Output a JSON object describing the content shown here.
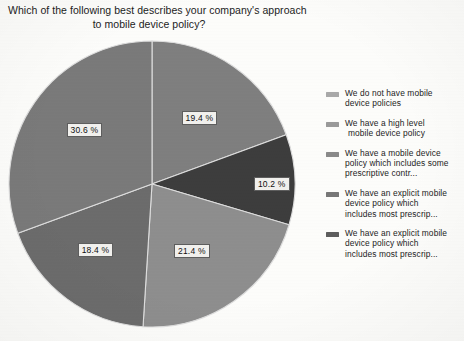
{
  "chart_data": {
    "type": "pie",
    "title": "Which of the following best describes your company's approach to mobile device policy?",
    "title_lines": [
      "Which of the following best describes your company's approach",
      "to mobile device policy?"
    ],
    "categories": [
      "We do not have mobile device policies",
      "We have a high level mobile device policy",
      "We have a mobile device policy which includes some prescriptive contr...",
      "We have an explicit mobile device policy which includes most prescrip...",
      "We have an explicit mobile device policy which includes most prescrip..."
    ],
    "values": [
      19.4,
      10.2,
      21.4,
      18.4,
      30.6
    ],
    "value_labels": [
      "19.4 %",
      "10.2 %",
      "21.4 %",
      "18.4 %",
      "30.6 %"
    ],
    "colors": [
      "#7f7f7f",
      "#3d3d3d",
      "#8e8e8e",
      "#6c6c6c",
      "#7a7a7a"
    ],
    "legend_position": "right",
    "grid": false,
    "xlabel": "",
    "ylabel": ""
  },
  "slices": [
    {
      "label": "19.4 %",
      "value": 19.4,
      "color": "#7f7f7f"
    },
    {
      "label": "10.2 %",
      "value": 10.2,
      "color": "#3d3d3d"
    },
    {
      "label": "21.4 %",
      "value": 21.4,
      "color": "#8e8e8e"
    },
    {
      "label": "18.4 %",
      "value": 18.4,
      "color": "#6c6c6c"
    },
    {
      "label": "30.6 %",
      "value": 30.6,
      "color": "#7a7a7a"
    }
  ],
  "legend": {
    "items": [
      {
        "swatch": "#a9a9a9",
        "lines": [
          "We do not have mobile",
          "device policies"
        ],
        "indent": [
          false,
          false
        ]
      },
      {
        "swatch": "#9a9a9a",
        "lines": [
          "We have a high level",
          "mobile device policy"
        ],
        "indent": [
          false,
          true
        ]
      },
      {
        "swatch": "#8a8a8a",
        "lines": [
          "We have a mobile device",
          "policy which includes some",
          "prescriptive contr..."
        ],
        "indent": [
          false,
          false,
          false
        ]
      },
      {
        "swatch": "#777777",
        "lines": [
          "We have an explicit mobile",
          "device policy which",
          "includes most prescrip..."
        ],
        "indent": [
          false,
          false,
          false
        ]
      },
      {
        "swatch": "#5e5e5e",
        "lines": [
          "We have an explicit mobile",
          "device policy which",
          "includes most prescrip..."
        ],
        "indent": [
          false,
          false,
          false
        ]
      }
    ]
  }
}
